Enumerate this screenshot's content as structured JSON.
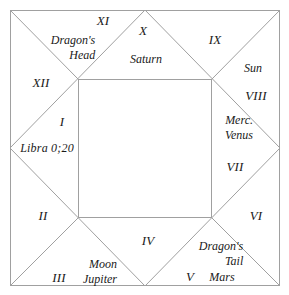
{
  "diagram": {
    "style": {
      "line_color": "#a0a0a0",
      "text_color": "#1a1a1a",
      "background": "#ffffff"
    },
    "geometry": {
      "outer_square": {
        "x": 10,
        "y": 10,
        "width": 270,
        "height": 276
      },
      "inner_square": {
        "x": 78,
        "y": 79,
        "width": 134,
        "height": 139
      },
      "edge_midpoints": {
        "top": [
          145,
          10
        ],
        "right": [
          280,
          148
        ],
        "bottom": [
          145,
          286
        ],
        "left": [
          10,
          148
        ]
      }
    },
    "houses": [
      {
        "numeral": "I",
        "x": 62,
        "y": 122
      },
      {
        "numeral": "II",
        "x": 43,
        "y": 216
      },
      {
        "numeral": "III",
        "x": 59,
        "y": 278
      },
      {
        "numeral": "IV",
        "x": 148,
        "y": 241
      },
      {
        "numeral": "V",
        "x": 190,
        "y": 277
      },
      {
        "numeral": "VI",
        "x": 256,
        "y": 216
      },
      {
        "numeral": "VII",
        "x": 235,
        "y": 167
      },
      {
        "numeral": "VIII",
        "x": 256,
        "y": 96
      },
      {
        "numeral": "IX",
        "x": 215,
        "y": 40
      },
      {
        "numeral": "X",
        "x": 143,
        "y": 31
      },
      {
        "numeral": "XI",
        "x": 103,
        "y": 21
      },
      {
        "numeral": "XII",
        "x": 41,
        "y": 83
      }
    ],
    "planets": [
      {
        "name": "Saturn",
        "lines": [
          "Saturn"
        ],
        "x": 146,
        "y": 59,
        "align": "center"
      },
      {
        "name": "Sun",
        "lines": [
          "Sun"
        ],
        "x": 253,
        "y": 68,
        "align": "center"
      },
      {
        "name": "Mercury-Venus",
        "lines": [
          "Merc.",
          "Venus"
        ],
        "x": 239,
        "y": 128,
        "align": "right"
      },
      {
        "name": "Dragons-Head",
        "lines": [
          "Dragon's",
          "Head"
        ],
        "x": 73,
        "y": 48,
        "align": "right"
      },
      {
        "name": "Dragons-Tail",
        "lines": [
          "Dragon's",
          "Tail"
        ],
        "x": 221,
        "y": 254,
        "align": "right"
      },
      {
        "name": "Mars",
        "lines": [
          "Mars"
        ],
        "x": 222,
        "y": 277,
        "align": "center"
      },
      {
        "name": "Moon-Jupiter",
        "lines": [
          "Moon",
          "Jupiter"
        ],
        "x": 100,
        "y": 272,
        "align": "right"
      }
    ],
    "ascendant": {
      "label": "Libra 0;20",
      "x": 47,
      "y": 148
    }
  }
}
